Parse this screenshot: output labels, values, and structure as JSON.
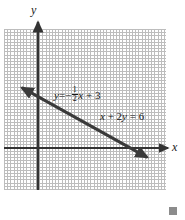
{
  "figure": {
    "type": "coordinate-plane-graph",
    "background_color": "#ffffff",
    "grid": {
      "style": "dotted",
      "color": "#bdbdbd",
      "cell_size_px": 17.5,
      "left_px": 4,
      "top_px": 29,
      "width_px": 162,
      "height_px": 161,
      "columns": 9,
      "rows": 9
    },
    "axes": {
      "color": "#333333",
      "origin_px": {
        "x": 38,
        "y": 148
      },
      "x_axis": {
        "label": "x",
        "orientation": "horizontal",
        "arrow": "right",
        "start_px": {
          "x": 4,
          "y": 148
        },
        "end_px": {
          "x": 168,
          "y": 148
        }
      },
      "y_axis": {
        "label": "y",
        "orientation": "vertical",
        "arrow": "up",
        "start_px": {
          "x": 38,
          "y": 190
        },
        "end_px": {
          "x": 38,
          "y": 22
        }
      }
    },
    "line": {
      "color": "#3a3a3a",
      "width_px": 3,
      "arrows": "both",
      "start_px": {
        "x": 17,
        "y": 85
      },
      "end_px": {
        "x": 152,
        "y": 160
      },
      "x_intercept": 6,
      "y_intercept": 3,
      "slope": -0.5
    },
    "end_marker": {
      "shape": "square",
      "color": "#8c8c8c",
      "size_px": 8
    }
  },
  "labels": {
    "y_axis_letter": "y",
    "x_axis_letter": "x",
    "equation_slope_intercept": {
      "lhs": "y",
      "equals": "=",
      "sign": "−",
      "numerator": "1",
      "denominator": "2",
      "variable": "x",
      "plus": "+",
      "constant": "3",
      "full_text": "y = −1/2 x + 3"
    },
    "equation_standard": {
      "full_text": "x + 2y = 6",
      "term1_coefficient": "",
      "term1_variable": "x",
      "operator": "+",
      "term2_coefficient": "2",
      "term2_variable": "y",
      "equals": "=",
      "rhs": "6"
    }
  },
  "chart_data": {
    "type": "line",
    "title": "",
    "xlabel": "x",
    "ylabel": "y",
    "grid": true,
    "legend": "none",
    "xlim": [
      -2,
      7
    ],
    "ylim": [
      -3,
      6
    ],
    "series": [
      {
        "name": "x + 2y = 6",
        "equations": [
          "y = -1/2 x + 3",
          "x + 2y = 6"
        ],
        "slope": -0.5,
        "intercept": 3,
        "x": [
          -1.2,
          6.5
        ],
        "y": [
          3.6,
          -0.25
        ],
        "arrows": "both"
      }
    ],
    "annotations": [
      {
        "text": "y = -1/2 x + 3",
        "x": 0.9,
        "y": 3.6
      },
      {
        "text": "x + 2y = 6",
        "x": 3.5,
        "y": 2.1
      }
    ]
  }
}
